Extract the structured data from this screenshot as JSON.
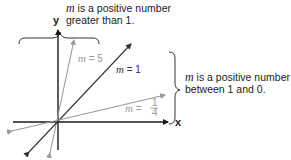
{
  "annotations": {
    "top": {
      "var": "m",
      "line1": " is a positive number",
      "line2": "greater than 1."
    },
    "right": {
      "var": "m",
      "line1": " is a positive number",
      "line2": "between 1 and 0."
    }
  },
  "axes": {
    "x_label": "x",
    "y_label": "y"
  },
  "lines": [
    {
      "id": "m5",
      "var": "m",
      "text": " = 5",
      "slope": 5,
      "color": "#9a9a9a"
    },
    {
      "id": "m1",
      "var": "m",
      "text": " = 1",
      "slope": 1,
      "color": "#333333"
    },
    {
      "id": "m14",
      "var": "m",
      "eq": " = ",
      "num": "1",
      "den": "4",
      "slope": 0.25,
      "color": "#9a9a9a"
    }
  ],
  "colors": {
    "axis": "#1a1a1a",
    "light_line": "#9a9a9a",
    "dark_line": "#333333",
    "brace": "#333333"
  }
}
